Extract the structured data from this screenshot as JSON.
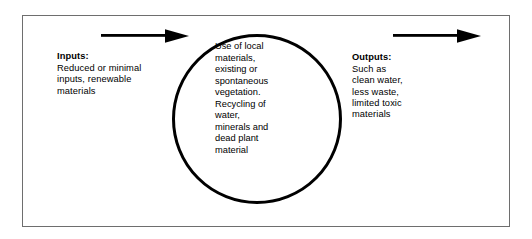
{
  "diagram": {
    "background_color": "#ffffff",
    "frame": {
      "border_color": "#6e6e6e",
      "name": "diagram-frame"
    },
    "circle": {
      "stroke_color": "#000000",
      "label": "Use of local materials, existing or spontaneous vegetation. Recycling of water, minerals and dead plant material",
      "text": "Use of local\nmaterials,\nexisting or\nspontaneous\nvegetation.\nRecycling of\nwater,\nminerals and\ndead plant\nmaterial"
    },
    "inputs": {
      "heading": "Inputs:",
      "body": "Reduced or minimal\ninputs, renewable\nmaterials",
      "arrow": {
        "icon": "arrow-right-icon",
        "color": "#000000",
        "direction": "right"
      }
    },
    "outputs": {
      "heading": "Outputs:",
      "body": "Such as\nclean water,\nless waste,\nlimited toxic\nmaterials",
      "arrow": {
        "icon": "arrow-right-icon",
        "color": "#000000",
        "direction": "right"
      }
    }
  }
}
